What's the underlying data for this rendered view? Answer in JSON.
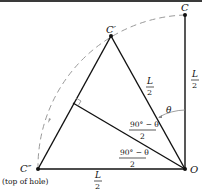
{
  "diagram": {
    "points": {
      "C": {
        "label": "C",
        "x": 185,
        "y": 15
      },
      "C_prime": {
        "label": "C′",
        "x": 111,
        "y": 36
      },
      "C_double_prime": {
        "label": "C″",
        "x": 38,
        "y": 169
      },
      "O": {
        "label": "O",
        "x": 185,
        "y": 169
      }
    },
    "labels": {
      "top_of_hole": "(top of hole)",
      "L": "L",
      "two": "2",
      "theta": "θ",
      "half_angle_num": "90° − θ",
      "half_angle_den": "2"
    },
    "colors": {
      "line": "#111111",
      "dashed_arc": "#999999",
      "text": "#111111"
    }
  }
}
